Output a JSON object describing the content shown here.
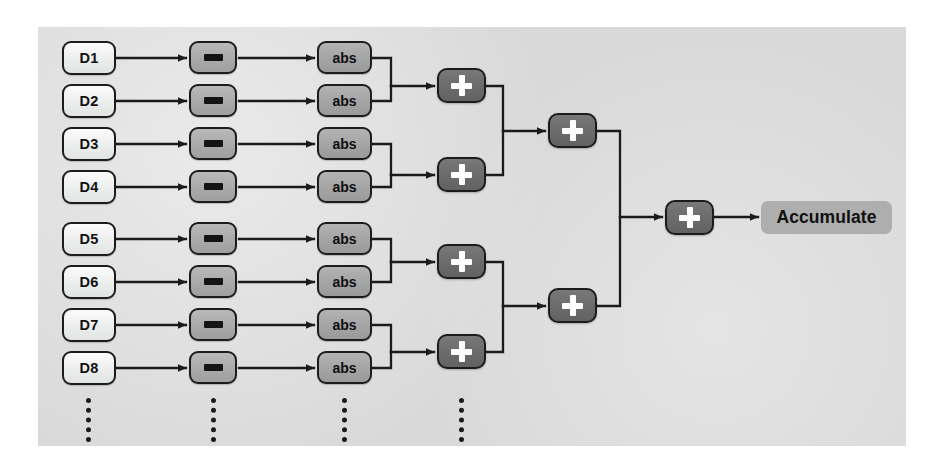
{
  "diagram": {
    "panel_color": "#d9d9d9",
    "page_background": "#ffffff",
    "columns": [
      {
        "name": "data-inputs",
        "label": "D"
      },
      {
        "name": "subtract-stage",
        "label": "-"
      },
      {
        "name": "absolute-stage",
        "label": "abs"
      },
      {
        "name": "adder-stage-1",
        "label": "+"
      },
      {
        "name": "adder-stage-2",
        "label": "+"
      },
      {
        "name": "adder-stage-3",
        "label": "+"
      },
      {
        "name": "output-stage",
        "label": "Accumulate"
      }
    ],
    "inputs": [
      {
        "label": "D1",
        "x": 62,
        "y": 41
      },
      {
        "label": "D2",
        "x": 62,
        "y": 84
      },
      {
        "label": "D3",
        "x": 62,
        "y": 127
      },
      {
        "label": "D4",
        "x": 62,
        "y": 170
      },
      {
        "label": "D5",
        "x": 62,
        "y": 222
      },
      {
        "label": "D6",
        "x": 62,
        "y": 265
      },
      {
        "label": "D7",
        "x": 62,
        "y": 308
      },
      {
        "label": "D8",
        "x": 62,
        "y": 351
      }
    ],
    "subtract_nodes": [
      {
        "glyph": "minus",
        "x": 189,
        "y": 41
      },
      {
        "glyph": "minus",
        "x": 189,
        "y": 84
      },
      {
        "glyph": "minus",
        "x": 189,
        "y": 127
      },
      {
        "glyph": "minus",
        "x": 189,
        "y": 170
      },
      {
        "glyph": "minus",
        "x": 189,
        "y": 222
      },
      {
        "glyph": "minus",
        "x": 189,
        "y": 265
      },
      {
        "glyph": "minus",
        "x": 189,
        "y": 308
      },
      {
        "glyph": "minus",
        "x": 189,
        "y": 351
      }
    ],
    "abs_nodes": [
      {
        "label": "abs",
        "x": 317,
        "y": 41
      },
      {
        "label": "abs",
        "x": 317,
        "y": 84
      },
      {
        "label": "abs",
        "x": 317,
        "y": 127
      },
      {
        "label": "abs",
        "x": 317,
        "y": 170
      },
      {
        "label": "abs",
        "x": 317,
        "y": 222
      },
      {
        "label": "abs",
        "x": 317,
        "y": 265
      },
      {
        "label": "abs",
        "x": 317,
        "y": 308
      },
      {
        "label": "abs",
        "x": 317,
        "y": 351
      }
    ],
    "adder_stage_1": [
      {
        "glyph": "plus",
        "x": 437,
        "y": 68
      },
      {
        "glyph": "plus",
        "x": 437,
        "y": 157
      },
      {
        "glyph": "plus",
        "x": 437,
        "y": 244
      },
      {
        "glyph": "plus",
        "x": 437,
        "y": 334
      }
    ],
    "adder_stage_2": [
      {
        "glyph": "plus",
        "x": 548,
        "y": 113
      },
      {
        "glyph": "plus",
        "x": 548,
        "y": 288
      }
    ],
    "adder_stage_3": [
      {
        "glyph": "plus",
        "x": 665,
        "y": 200
      }
    ],
    "output": {
      "label": "Accumulate",
      "x": 761,
      "y": 201
    },
    "ellipses": [
      {
        "name": "inputs-ellipsis",
        "x": 86,
        "y": 398
      },
      {
        "name": "subtract-ellipsis",
        "x": 211,
        "y": 398
      },
      {
        "name": "abs-ellipsis",
        "x": 342,
        "y": 398
      },
      {
        "name": "adder-ellipsis",
        "x": 459,
        "y": 398
      }
    ],
    "wire_color": "#1b1b1b"
  }
}
